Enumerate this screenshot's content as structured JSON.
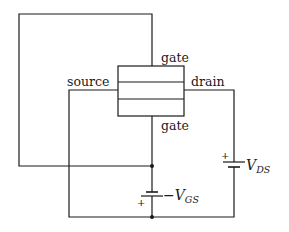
{
  "diagram": {
    "type": "circuit",
    "labels": {
      "gate_top": "gate",
      "gate_bottom": "gate",
      "source": "source",
      "drain": "drain"
    },
    "sources": {
      "vgs": {
        "prefix": "−",
        "main": "V",
        "subscript": "GS",
        "plus": "+"
      },
      "vds": {
        "main": "V",
        "subscript": "DS",
        "plus": "+"
      }
    },
    "colors": {
      "line": "#1a1a1a",
      "background": "#ffffff"
    }
  }
}
